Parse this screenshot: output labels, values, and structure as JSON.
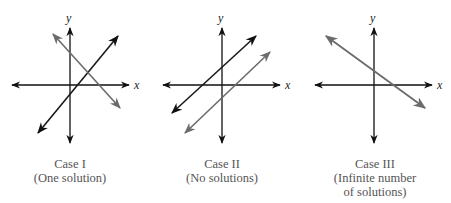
{
  "axis_labels": {
    "x": "x",
    "y": "y"
  },
  "colors": {
    "axis": "#111111",
    "line_dark": "#1a1a1a",
    "line_gray": "#6b6b6b",
    "caption": "#555555"
  },
  "cases": [
    {
      "title": "Case I",
      "subtitle": "(One solution)",
      "subtitle2": ""
    },
    {
      "title": "Case II",
      "subtitle": "(No solutions)",
      "subtitle2": ""
    },
    {
      "title": "Case III",
      "subtitle": "(Infinite number",
      "subtitle2": "of solutions)"
    }
  ]
}
